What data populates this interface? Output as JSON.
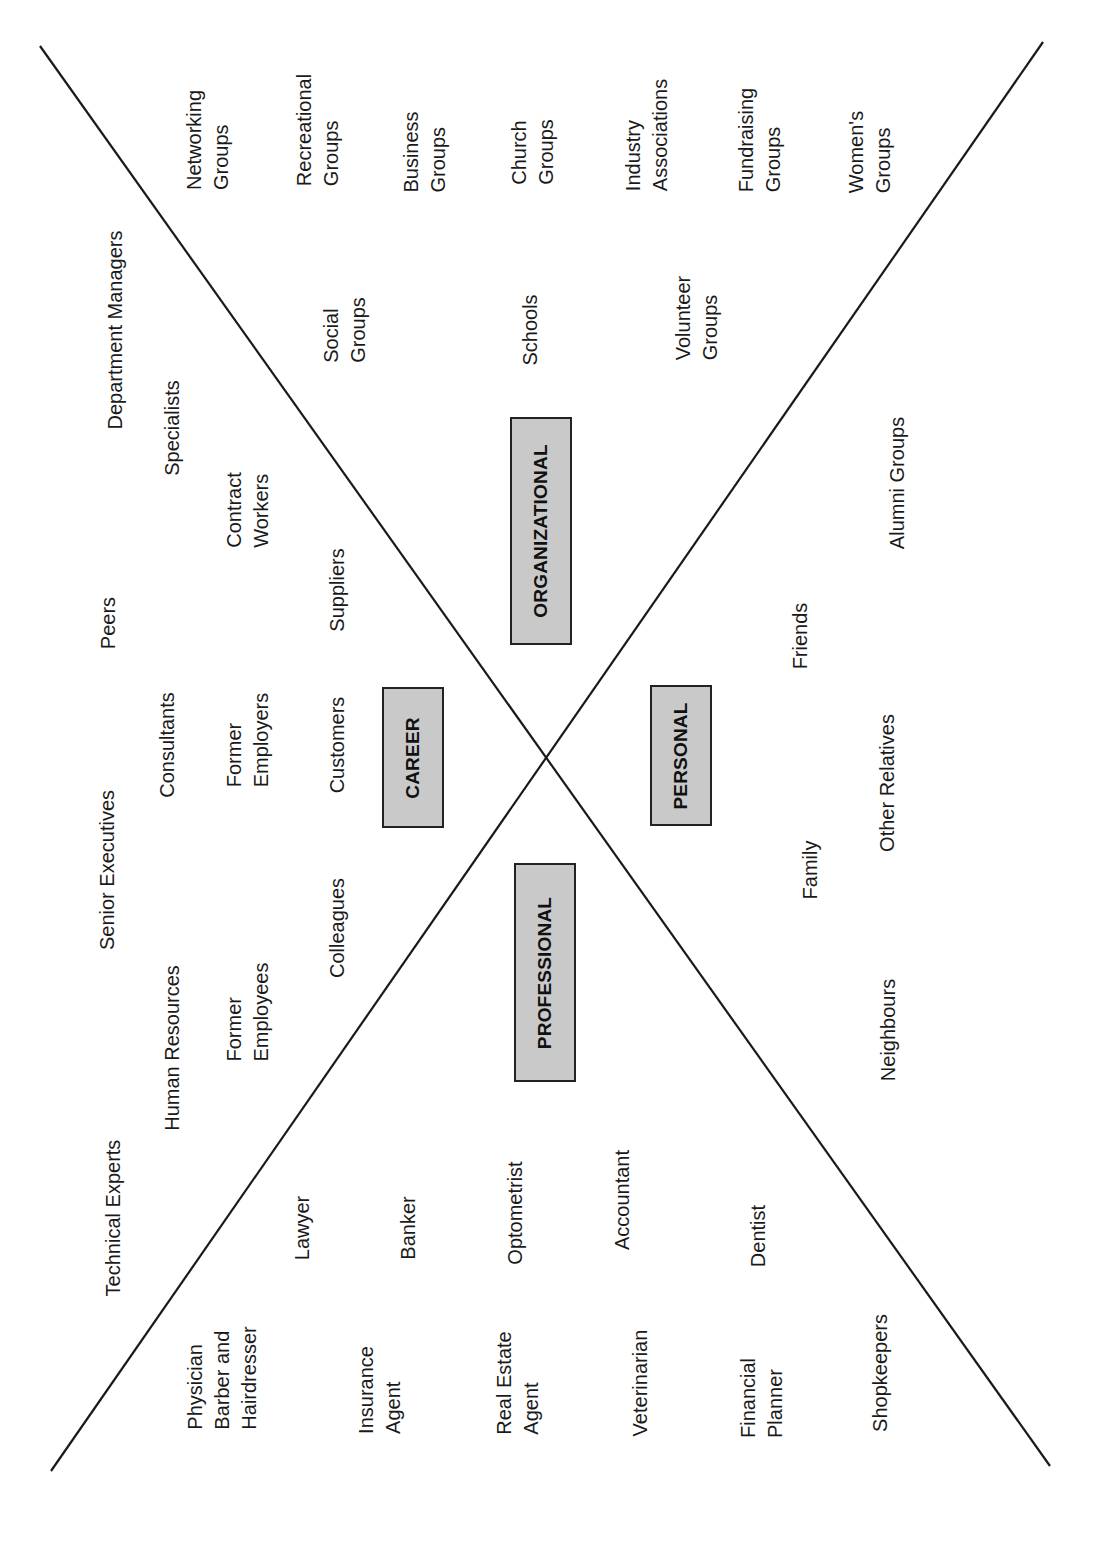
{
  "diagram": {
    "type": "x-shaped network map",
    "orientation": "rotated -90deg (text reads bottom to top)",
    "lines": [
      {
        "name": "diagonal-a",
        "x1": 40,
        "y1": 46,
        "x2": 1050,
        "y2": 1466
      },
      {
        "name": "diagonal-b",
        "x1": 1043,
        "y1": 42,
        "x2": 51,
        "y2": 1471
      }
    ],
    "colors": {
      "line": "#1a1a1a",
      "box_fill": "#c9c9c9",
      "box_border": "#222222",
      "text": "#1a1a1a"
    },
    "categories": [
      {
        "id": "organizational",
        "label": "ORGANIZATIONAL",
        "x": 510,
        "y": 417,
        "w": 62,
        "h": 228
      },
      {
        "id": "career",
        "label": "CAREER",
        "x": 382,
        "y": 687,
        "w": 62,
        "h": 141
      },
      {
        "id": "personal",
        "label": "PERSONAL",
        "x": 650,
        "y": 685,
        "w": 62,
        "h": 141
      },
      {
        "id": "professional",
        "label": "PROFESSIONAL",
        "x": 514,
        "y": 863,
        "w": 62,
        "h": 219
      }
    ],
    "sections": {
      "organizational": [
        {
          "text": "Networking\nGroups",
          "x": 208,
          "y": 140
        },
        {
          "text": "Recreational\nGroups",
          "x": 318,
          "y": 130
        },
        {
          "text": "Business\nGroups",
          "x": 425,
          "y": 152
        },
        {
          "text": "Church\nGroups",
          "x": 533,
          "y": 152
        },
        {
          "text": "Industry\nAssociations",
          "x": 647,
          "y": 135
        },
        {
          "text": "Fundraising\nGroups",
          "x": 760,
          "y": 140
        },
        {
          "text": "Women's\nGroups",
          "x": 870,
          "y": 152
        },
        {
          "text": "Social\nGroups",
          "x": 345,
          "y": 330
        },
        {
          "text": "Schools",
          "x": 530,
          "y": 330
        },
        {
          "text": "Volunteer\nGroups",
          "x": 697,
          "y": 318
        },
        {
          "text": "Alumni Groups",
          "x": 897,
          "y": 483
        }
      ],
      "career": [
        {
          "text": "Department Managers",
          "x": 115,
          "y": 330
        },
        {
          "text": "Specialists",
          "x": 172,
          "y": 428
        },
        {
          "text": "Contract\nWorkers",
          "x": 248,
          "y": 510
        },
        {
          "text": "Peers",
          "x": 108,
          "y": 623
        },
        {
          "text": "Suppliers",
          "x": 337,
          "y": 590
        },
        {
          "text": "Consultants",
          "x": 167,
          "y": 745
        },
        {
          "text": "Former\nEmployers",
          "x": 248,
          "y": 740
        },
        {
          "text": "Customers",
          "x": 337,
          "y": 745
        },
        {
          "text": "Senior Executives",
          "x": 107,
          "y": 870
        },
        {
          "text": "Colleagues",
          "x": 337,
          "y": 928
        },
        {
          "text": "Former\nEmployees",
          "x": 248,
          "y": 1012
        },
        {
          "text": "Human Resources",
          "x": 172,
          "y": 1048
        },
        {
          "text": "Technical Experts",
          "x": 113,
          "y": 1218
        }
      ],
      "personal": [
        {
          "text": "Friends",
          "x": 800,
          "y": 636
        },
        {
          "text": "Other Relatives",
          "x": 887,
          "y": 783
        },
        {
          "text": "Family",
          "x": 810,
          "y": 870
        },
        {
          "text": "Neighbours",
          "x": 888,
          "y": 1030
        }
      ],
      "professional": [
        {
          "text": "Lawyer",
          "x": 302,
          "y": 1228
        },
        {
          "text": "Banker",
          "x": 408,
          "y": 1228
        },
        {
          "text": "Optometrist",
          "x": 515,
          "y": 1213
        },
        {
          "text": "Accountant",
          "x": 622,
          "y": 1200
        },
        {
          "text": "Dentist",
          "x": 758,
          "y": 1236
        },
        {
          "text": "Physician\nBarber and\nHairdresser",
          "x": 222,
          "y": 1378
        },
        {
          "text": "Insurance\nAgent",
          "x": 380,
          "y": 1390
        },
        {
          "text": "Real Estate\nAgent",
          "x": 518,
          "y": 1383
        },
        {
          "text": "Veterinarian",
          "x": 640,
          "y": 1383
        },
        {
          "text": "Financial\nPlanner",
          "x": 762,
          "y": 1398
        },
        {
          "text": "Shopkeepers",
          "x": 880,
          "y": 1373
        }
      ]
    }
  }
}
